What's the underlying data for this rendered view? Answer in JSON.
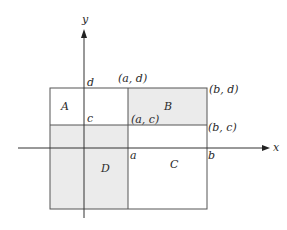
{
  "diagram": {
    "axes": {
      "x_label": "x",
      "y_label": "y"
    },
    "regions": [
      {
        "id": "A",
        "label": "A",
        "shaded": false
      },
      {
        "id": "B",
        "label": "B",
        "shaded": true
      },
      {
        "id": "C",
        "label": "C",
        "shaded": false
      },
      {
        "id": "D",
        "label": "D",
        "shaded": true
      }
    ],
    "point_labels": {
      "a_d": "(a, d)",
      "b_d": "(b, d)",
      "a_c": "(a, c)",
      "b_c": "(b, c)"
    },
    "tick_labels": {
      "d": "d",
      "c": "c",
      "a": "a",
      "b": "b"
    },
    "colors": {
      "shade": "#ebebeb",
      "line": "#333333",
      "rect_line": "#555555"
    }
  }
}
